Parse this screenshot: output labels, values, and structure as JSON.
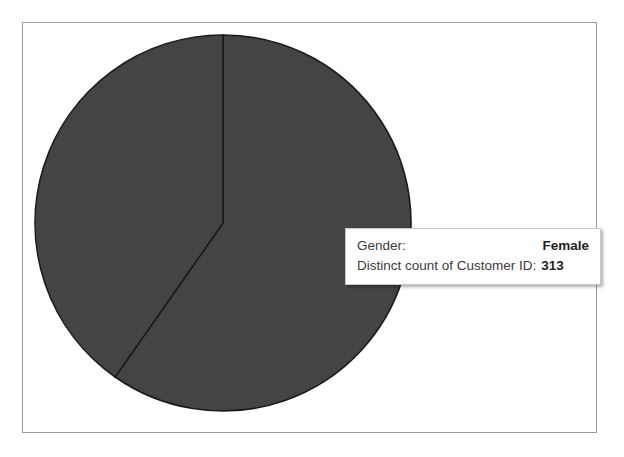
{
  "chart_data": {
    "type": "pie",
    "title": "",
    "categories": [
      "Female",
      "Male"
    ],
    "values": [
      313,
      212
    ],
    "labels": [
      "Female",
      "Male"
    ],
    "measure_name": "Distinct count of Customer ID",
    "dimension_name": "Gender",
    "total": 525,
    "slice_angles_deg": [
      215,
      145
    ],
    "start_angle_deg": 0,
    "direction": "clockwise",
    "legend": "none",
    "grid": false,
    "colors": {
      "slice_fill": "#444447",
      "slice_border": "#1a1a1a",
      "plot_background": "#ffffff",
      "frame_border": "#9a9a9a"
    }
  },
  "tooltip": {
    "dimension_label": "Gender:",
    "dimension_value": "Female",
    "measure_label": "Distinct count of Customer ID:",
    "measure_value": "313"
  }
}
